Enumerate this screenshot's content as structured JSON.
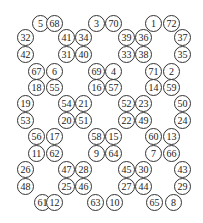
{
  "puzzle": {
    "rows_y": [
      24,
      38,
      55,
      72,
      88,
      104,
      121,
      137,
      154,
      170,
      187,
      203
    ],
    "cells": [
      {
        "n": "5",
        "x": 41,
        "y": 24
      },
      {
        "n": "68",
        "x": 55,
        "y": 24
      },
      {
        "n": "3",
        "x": 97,
        "y": 24
      },
      {
        "n": "70",
        "x": 114,
        "y": 24
      },
      {
        "n": "1",
        "x": 154,
        "y": 24
      },
      {
        "n": "72",
        "x": 172,
        "y": 24
      },
      {
        "n": "32",
        "x": 26,
        "y": 38
      },
      {
        "n": "41",
        "x": 67,
        "y": 38
      },
      {
        "n": "34",
        "x": 84,
        "y": 38
      },
      {
        "n": "39",
        "x": 127,
        "y": 38
      },
      {
        "n": "36",
        "x": 144,
        "y": 38
      },
      {
        "n": "37",
        "x": 183,
        "y": 38
      },
      {
        "n": "42",
        "x": 26,
        "y": 55
      },
      {
        "n": "31",
        "x": 67,
        "y": 55
      },
      {
        "n": "40",
        "x": 84,
        "y": 55
      },
      {
        "n": "33",
        "x": 127,
        "y": 55
      },
      {
        "n": "38",
        "x": 144,
        "y": 55
      },
      {
        "n": "35",
        "x": 183,
        "y": 55
      },
      {
        "n": "67",
        "x": 37,
        "y": 72
      },
      {
        "n": "6",
        "x": 55,
        "y": 72
      },
      {
        "n": "69",
        "x": 97,
        "y": 72
      },
      {
        "n": "4",
        "x": 114,
        "y": 72
      },
      {
        "n": "71",
        "x": 154,
        "y": 72
      },
      {
        "n": "2",
        "x": 172,
        "y": 72
      },
      {
        "n": "18",
        "x": 37,
        "y": 88
      },
      {
        "n": "55",
        "x": 55,
        "y": 88
      },
      {
        "n": "16",
        "x": 97,
        "y": 88
      },
      {
        "n": "57",
        "x": 114,
        "y": 88
      },
      {
        "n": "14",
        "x": 154,
        "y": 88
      },
      {
        "n": "59",
        "x": 172,
        "y": 88
      },
      {
        "n": "19",
        "x": 26,
        "y": 104
      },
      {
        "n": "54",
        "x": 67,
        "y": 104
      },
      {
        "n": "21",
        "x": 84,
        "y": 104
      },
      {
        "n": "52",
        "x": 127,
        "y": 104
      },
      {
        "n": "23",
        "x": 144,
        "y": 104
      },
      {
        "n": "50",
        "x": 183,
        "y": 104
      },
      {
        "n": "53",
        "x": 26,
        "y": 121
      },
      {
        "n": "20",
        "x": 67,
        "y": 121
      },
      {
        "n": "51",
        "x": 84,
        "y": 121
      },
      {
        "n": "22",
        "x": 127,
        "y": 121
      },
      {
        "n": "49",
        "x": 144,
        "y": 121
      },
      {
        "n": "24",
        "x": 183,
        "y": 121
      },
      {
        "n": "56",
        "x": 37,
        "y": 137
      },
      {
        "n": "17",
        "x": 55,
        "y": 137
      },
      {
        "n": "58",
        "x": 97,
        "y": 137
      },
      {
        "n": "15",
        "x": 114,
        "y": 137
      },
      {
        "n": "60",
        "x": 154,
        "y": 137
      },
      {
        "n": "13",
        "x": 172,
        "y": 137
      },
      {
        "n": "11",
        "x": 37,
        "y": 154
      },
      {
        "n": "62",
        "x": 55,
        "y": 154
      },
      {
        "n": "9",
        "x": 97,
        "y": 154
      },
      {
        "n": "64",
        "x": 114,
        "y": 154
      },
      {
        "n": "7",
        "x": 154,
        "y": 154
      },
      {
        "n": "66",
        "x": 172,
        "y": 154
      },
      {
        "n": "26",
        "x": 26,
        "y": 170
      },
      {
        "n": "47",
        "x": 67,
        "y": 170
      },
      {
        "n": "28",
        "x": 84,
        "y": 170
      },
      {
        "n": "45",
        "x": 127,
        "y": 170
      },
      {
        "n": "30",
        "x": 144,
        "y": 170
      },
      {
        "n": "43",
        "x": 183,
        "y": 170
      },
      {
        "n": "48",
        "x": 26,
        "y": 187
      },
      {
        "n": "25",
        "x": 67,
        "y": 187
      },
      {
        "n": "46",
        "x": 84,
        "y": 187
      },
      {
        "n": "27",
        "x": 127,
        "y": 187
      },
      {
        "n": "44",
        "x": 144,
        "y": 187
      },
      {
        "n": "29",
        "x": 183,
        "y": 187
      },
      {
        "n": "61",
        "x": 43,
        "y": 203
      },
      {
        "n": "12",
        "x": 55,
        "y": 203
      },
      {
        "n": "63",
        "x": 96,
        "y": 203
      },
      {
        "n": "10",
        "x": 115,
        "y": 203
      },
      {
        "n": "65",
        "x": 155,
        "y": 203
      },
      {
        "n": "8",
        "x": 174,
        "y": 203
      }
    ]
  }
}
